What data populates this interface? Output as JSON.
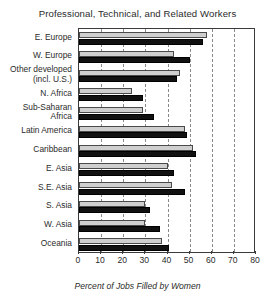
{
  "chart_data": {
    "type": "bar",
    "orientation": "horizontal",
    "title": "Professional, Technical, and Related Workers",
    "xlabel": "Percent of Jobs Filled by Women",
    "ylabel": "",
    "xlim": [
      0,
      80
    ],
    "xticks": [
      0,
      10,
      20,
      30,
      40,
      50,
      60,
      70,
      80
    ],
    "grid": true,
    "legend": "none",
    "categories": [
      "E. Europe",
      "W. Europe",
      "Other developed\n(incl. U.S.)",
      "N. Africa",
      "Sub-Saharan\nAfrica",
      "Latin America",
      "Caribbean",
      "E. Asia",
      "S.E. Asia",
      "S. Asia",
      "W. Asia",
      "Oceania"
    ],
    "series": [
      {
        "name": "light",
        "color": "#cfcfcf",
        "values": [
          58,
          43,
          45.5,
          24,
          29,
          48,
          51.5,
          40,
          42,
          30,
          30,
          37.5
        ]
      },
      {
        "name": "dark",
        "color": "#111111",
        "values": [
          56,
          50,
          44.5,
          29,
          34,
          49,
          53,
          43,
          48,
          32,
          36.5,
          40.5
        ]
      }
    ]
  }
}
